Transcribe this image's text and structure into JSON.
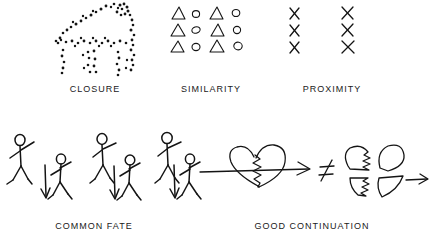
{
  "figure": {
    "background_color": "#ffffff",
    "ink_color": "#141414",
    "style": "hand-drawn black ink line art on white",
    "topic": "Gestalt grouping principles"
  },
  "panels": [
    {
      "id": "closure",
      "caption": "CLOSURE",
      "graphic": "dotted-house-outline",
      "description": "Outline of a house / barn shape rendered only as scattered ink dots; the contour is implied, not drawn",
      "dot_count": 78
    },
    {
      "id": "similarity",
      "caption": "SIMILARITY",
      "graphic": "triangle-circle-grid",
      "description": "Grid of small shapes, columns alternate between triangles and circles",
      "rows": 3,
      "columns": 4,
      "column_shapes": [
        "triangle",
        "circle",
        "triangle",
        "circle"
      ]
    },
    {
      "id": "proximity",
      "caption": "PROXIMITY",
      "graphic": "two-columns-of-x",
      "description": "Two widely separated columns, each with three X marks",
      "groups": 2,
      "marks_per_group": 3,
      "mark_glyph": "X"
    },
    {
      "id": "common-fate",
      "caption": "COMMON FATE",
      "graphic": "stick-figures-with-arrows",
      "description": "Six dancing stick figures; three of them have a downward arrow beside them indicating shared motion",
      "figure_count": 6,
      "figures_with_arrow": 3,
      "arrow_direction": "down"
    },
    {
      "id": "good-continuation",
      "caption": "GOOD CONTINUATION",
      "graphic": "heart-split-vs-fragments",
      "description": "A heart split by a jagged zigzag crack and pierced by a straight horizontal arrow, a not-equals sign, then the same heart broken into four separated pinwheel fragments with an arrow",
      "relation_symbol": "≠",
      "left_arrow_direction": "right",
      "right_arrow_direction": "right",
      "fragment_count": 4
    }
  ]
}
